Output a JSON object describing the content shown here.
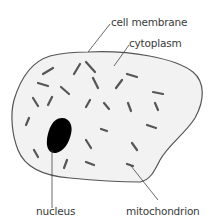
{
  "diagram": {
    "labels": {
      "cell_membrane": "cell membrane",
      "cytoplasm": "cytoplasm",
      "nucleus": "nucleus",
      "mitochondrion": "mitochondrion"
    },
    "colors": {
      "cell_fill": "#f2f2f2",
      "outline": "#555555",
      "nucleus": "#000000",
      "mitochondria": "#555555",
      "text": "#3a3a3a"
    },
    "mitochondria": [
      [
        43,
        74,
        53,
        68
      ],
      [
        74,
        74,
        80,
        64
      ],
      [
        86,
        62,
        95,
        72
      ],
      [
        93,
        78,
        98,
        88
      ],
      [
        38,
        83,
        48,
        86
      ],
      [
        61,
        87,
        69,
        94
      ],
      [
        33,
        98,
        38,
        106
      ],
      [
        48,
        105,
        52,
        97
      ],
      [
        127,
        74,
        137,
        77
      ],
      [
        116,
        88,
        122,
        80
      ],
      [
        153,
        92,
        163,
        94
      ],
      [
        155,
        103,
        158,
        110
      ],
      [
        86,
        107,
        90,
        100
      ],
      [
        104,
        103,
        109,
        109
      ],
      [
        128,
        103,
        131,
        111
      ],
      [
        26,
        125,
        29,
        118
      ],
      [
        101,
        129,
        107,
        131
      ],
      [
        147,
        125,
        156,
        128
      ],
      [
        86,
        140,
        91,
        148
      ],
      [
        132,
        143,
        137,
        150
      ],
      [
        34,
        150,
        38,
        157
      ],
      [
        64,
        168,
        67,
        160
      ],
      [
        86,
        162,
        94,
        165
      ],
      [
        127,
        164,
        133,
        166
      ]
    ]
  }
}
